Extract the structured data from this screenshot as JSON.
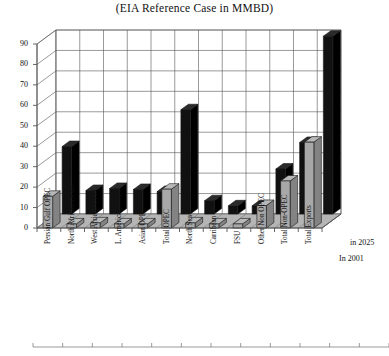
{
  "title": "(EIA Reference Case in MMBD)",
  "depth_labels": {
    "back": "in 2025",
    "front": "In 2001"
  },
  "chart_data": {
    "type": "bar",
    "title": "(EIA Reference Case in MMBD)",
    "xlabel": "",
    "ylabel": "",
    "ylim": [
      0,
      90
    ],
    "yticks": [
      0,
      10,
      20,
      30,
      40,
      50,
      60,
      70,
      80,
      90
    ],
    "grid": true,
    "legend_position": "depth-axis-right",
    "projection": "3d-two-row",
    "categories": [
      "Persian Gulf OPEC",
      "North African OPEC",
      "West African OPEC",
      "L. American OPEC",
      "Asian OPEC",
      "Total OPEC",
      "North Sea",
      "Carribean",
      "FSU",
      "Other Non OPEC",
      "Total Non-OPEC",
      "Total Exports"
    ],
    "series": [
      {
        "name": "In 2001",
        "row": "front",
        "color": "#a8a8a8",
        "values": [
          15.5,
          2.0,
          2.5,
          2.0,
          2.0,
          19.0,
          2.5,
          2.0,
          2.0,
          11.0,
          23.0,
          42.0
        ]
      },
      {
        "name": "in 2025",
        "row": "back",
        "color": "#111111",
        "values": [
          33.0,
          11.5,
          12.5,
          12.0,
          11.0,
          51.0,
          6.5,
          4.0,
          4.0,
          22.0,
          35.0,
          87.0
        ]
      }
    ]
  },
  "colors": {
    "series_2001": "#a8a8a8",
    "series_2025": "#111111",
    "grid": "#555555",
    "axis": "#555555",
    "floor": "#9a9a9a",
    "text": "#111111"
  }
}
